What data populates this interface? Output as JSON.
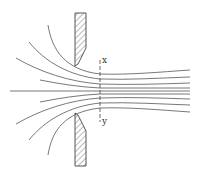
{
  "diagram": {
    "type": "flow-through-orifice",
    "labels": {
      "top": "x",
      "bottom": "y"
    },
    "colors": {
      "stroke": "#555555",
      "background": "#ffffff"
    }
  }
}
